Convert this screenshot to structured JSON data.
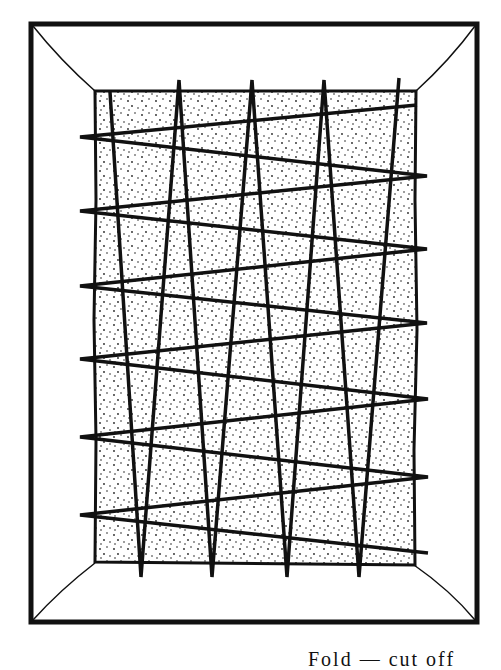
{
  "figure": {
    "colors": {
      "ink": "#111111",
      "background": "#ffffff",
      "stipple": "#222222"
    },
    "outer_frame": {
      "x1": 31,
      "y1": 24,
      "x2": 477,
      "y2": 622
    },
    "inner_canvas": {
      "x1": 95,
      "y1": 91,
      "x2": 416,
      "y2": 563
    },
    "vertical_zigzag": [
      [
        110,
        92
      ],
      [
        141,
        577
      ],
      [
        179,
        80
      ],
      [
        212,
        577
      ],
      [
        252,
        80
      ],
      [
        287,
        577
      ],
      [
        324,
        80
      ],
      [
        359,
        577
      ],
      [
        399,
        78
      ],
      [
        359,
        577
      ]
    ],
    "horizontal_zigzag": [
      [
        417,
        105
      ],
      [
        80,
        137
      ],
      [
        427,
        176
      ],
      [
        80,
        211
      ],
      [
        427,
        249
      ],
      [
        80,
        286
      ],
      [
        427,
        323
      ],
      [
        80,
        359
      ],
      [
        428,
        399
      ],
      [
        80,
        437
      ],
      [
        428,
        477
      ],
      [
        80,
        515
      ],
      [
        428,
        553
      ]
    ],
    "caption_partial": "Fold — cut off"
  }
}
